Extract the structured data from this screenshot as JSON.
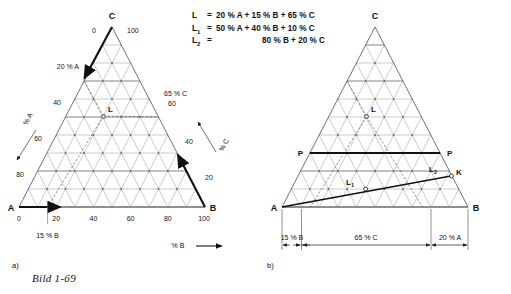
{
  "figure": {
    "caption": "Bild 1-69",
    "panel_a_label": "a)",
    "panel_b_label": "b)",
    "faint_header": ""
  },
  "equations": [
    {
      "name": "L",
      "sub": "",
      "eq": "=",
      "rhs": "20 % A + 15 % B + 65 % C",
      "indent": false
    },
    {
      "name": "L",
      "sub": "1",
      "eq": "=",
      "rhs": "50 % A + 40 % B + 10 % C",
      "indent": false
    },
    {
      "name": "L",
      "sub": "2",
      "eq": "=",
      "rhs": "80 % B + 20 % C",
      "indent": true
    }
  ],
  "panel_a": {
    "corners": {
      "top": "C",
      "left": "A",
      "right": "B"
    },
    "top_ticks": {
      "left": "0",
      "right": "100"
    },
    "left_axis_labels": [
      "20 % A",
      "40",
      "60",
      "80"
    ],
    "left_axis_title": "% A",
    "right_axis_labels": [
      "65 % C",
      "60",
      "40",
      "20"
    ],
    "right_axis_title": "% C",
    "bottom_ticks": [
      "0",
      "20",
      "40",
      "60",
      "80",
      "100"
    ],
    "bottom_axis_title": "% B",
    "bottom_callout": "15 % B",
    "point_label": "L"
  },
  "panel_b": {
    "corners": {
      "top": "C",
      "left": "A",
      "right": "B"
    },
    "point_labels": {
      "L": "L",
      "L1": "L",
      "L1sub": "1",
      "L2": "L",
      "L2sub": "2",
      "K": "K"
    },
    "tie_line_labels": {
      "left": "P",
      "right": "P"
    },
    "dimensions": [
      {
        "label": "15 % B"
      },
      {
        "label": "65 % C"
      },
      {
        "label": "20 % A"
      }
    ]
  },
  "colors": {
    "grid": "#7a7a7a",
    "grid_light": "#9a9a9a",
    "highlight": "#b9b9b9",
    "stroke_bold": "#111111",
    "text": "#111111",
    "dim_line": "#333333"
  }
}
